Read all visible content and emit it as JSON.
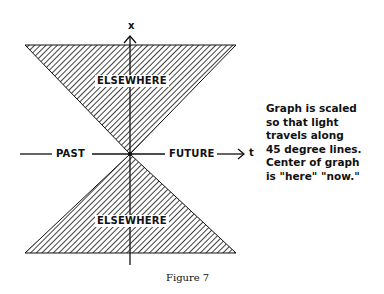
{
  "diagram": {
    "axis_x_label": "x",
    "axis_t_label": "t",
    "regions": {
      "top": "ELSEWHERE",
      "bottom": "ELSEWHERE",
      "left": "PAST",
      "right": "FUTURE"
    },
    "note": "Graph is scaled\nso that light\ntravels along\n45 degree lines.\nCenter of graph\nis \"here\" \"now.\"",
    "caption": "Figure 7"
  }
}
